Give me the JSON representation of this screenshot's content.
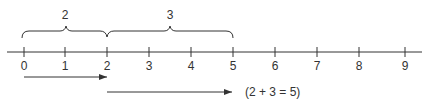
{
  "diagram": {
    "number_line": {
      "ticks": [
        "0",
        "1",
        "2",
        "3",
        "4",
        "5",
        "6",
        "7",
        "8",
        "9"
      ],
      "tick_x": [
        24,
        65,
        107,
        149,
        191,
        233,
        275,
        317,
        359,
        405
      ],
      "axis_y": 52,
      "axis_x_range": [
        7,
        422
      ]
    },
    "braces": [
      {
        "label": "2",
        "from": 0,
        "to": 2
      },
      {
        "label": "3",
        "from": 2,
        "to": 5
      }
    ],
    "arrows": [
      {
        "from": 0,
        "to": 2,
        "y": 77
      },
      {
        "from": 2,
        "to": 5,
        "y": 92
      }
    ],
    "equation": "(2 + 3 = 5)",
    "colors": {
      "ink": "#333333"
    }
  }
}
